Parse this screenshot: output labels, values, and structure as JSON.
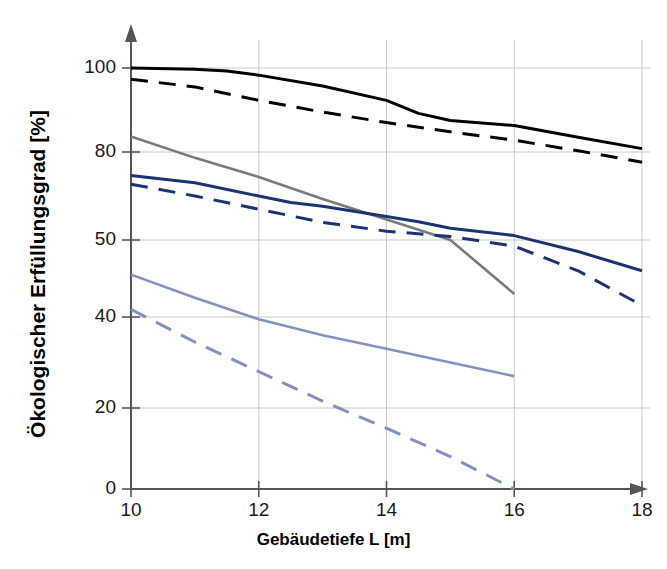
{
  "chart_data": {
    "type": "line",
    "title": "",
    "xlabel": "Gebäudetiefe L [m]",
    "ylabel": "Ökologischer Erfüllungsgrad [%]",
    "xticks": [
      10,
      12,
      14,
      16,
      18
    ],
    "xtick_labels": [
      "10",
      "12",
      "14",
      "16",
      "18"
    ],
    "yticks": [
      0,
      20,
      40,
      50,
      80,
      100
    ],
    "ytick_labels": [
      "0",
      "20",
      "40",
      "50",
      "80",
      "100"
    ],
    "xlim": [
      10,
      18
    ],
    "ylim": [
      0,
      100
    ],
    "grid": true,
    "grid_color": "#c8c8c8",
    "axis_color": "#555555",
    "legend": "none",
    "series": [
      {
        "name": "series-1-black-solid",
        "color": "#000000",
        "style": "solid",
        "width": 3.0,
        "x": [
          10,
          11,
          11.5,
          12,
          13,
          14,
          14.5,
          15,
          16,
          17,
          18
        ],
        "y": [
          100,
          99.7,
          99.3,
          98.3,
          95.7,
          92.3,
          89.2,
          87.5,
          86.3,
          83.5,
          80.8
        ]
      },
      {
        "name": "series-2-black-dashed",
        "color": "#000000",
        "style": "dashed",
        "width": 3.0,
        "x": [
          10,
          11,
          12,
          13,
          14,
          15,
          16,
          17,
          18
        ],
        "y": [
          97.3,
          95.5,
          92.3,
          89.5,
          87.0,
          84.8,
          82.8,
          80.3,
          76.5
        ]
      },
      {
        "name": "series-3-gray-solid",
        "color": "#7a7a7a",
        "style": "solid",
        "width": 2.6,
        "x": [
          10,
          11,
          12,
          13,
          14,
          15,
          16
        ],
        "y": [
          83.7,
          78.0,
          71.5,
          64.0,
          57.0,
          50.0,
          43.0
        ]
      },
      {
        "name": "series-4-darkblue-solid",
        "color": "#1c3373",
        "style": "solid",
        "width": 3.0,
        "x": [
          10,
          11,
          12,
          12.5,
          13,
          14,
          14.5,
          15,
          16,
          17,
          18
        ],
        "y": [
          72.0,
          69.5,
          65.0,
          62.8,
          61.5,
          58.0,
          56.2,
          54.0,
          51.5,
          48.5,
          46.0
        ]
      },
      {
        "name": "series-5-darkblue-dashed",
        "color": "#1c3373",
        "style": "dashed",
        "width": 3.0,
        "x": [
          10,
          11,
          12,
          13,
          14,
          15,
          16,
          17,
          18
        ],
        "y": [
          69.0,
          65.0,
          60.5,
          56.0,
          53.0,
          51.2,
          49.2,
          46.0,
          41.5
        ]
      },
      {
        "name": "series-6-lightblue-solid",
        "color": "#8491be",
        "style": "solid",
        "width": 2.6,
        "x": [
          10,
          11,
          12,
          13,
          14,
          15,
          16
        ],
        "y": [
          45.5,
          42.5,
          39.5,
          36.0,
          33.0,
          30.0,
          27.0
        ]
      },
      {
        "name": "series-7-lightblue-dashed",
        "color": "#8491be",
        "style": "dashed",
        "width": 3.0,
        "x": [
          10,
          11,
          12,
          13,
          14,
          15,
          16
        ],
        "y": [
          41.0,
          34.5,
          28.0,
          21.5,
          15.0,
          8.0,
          0.0
        ]
      }
    ]
  }
}
